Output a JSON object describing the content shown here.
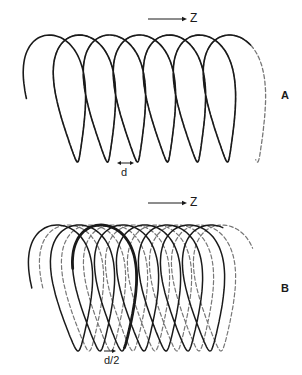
{
  "figure": {
    "panels": [
      {
        "id": "A",
        "label": "A",
        "axis_label": "Z",
        "dimension_label": "d",
        "solid_helix": {
          "x0": 56,
          "turns": 6.35,
          "pitch": 30,
          "top_y": 35,
          "bottom_y": 162,
          "rx": 34,
          "shift": 6.5,
          "color": "#1a1a1a",
          "width": 1.6
        },
        "dashed_helix": {
          "x0": 56,
          "t_start_offset": 5.2,
          "turns": 6.3,
          "pitch": 30,
          "top_y": 35,
          "bottom_y": 162,
          "rx": 34,
          "shift": 6.5,
          "color": "#777777",
          "width": 1.3,
          "phase_dx": 0
        },
        "arrow": {
          "x1": 148,
          "x2": 187,
          "y": 19
        },
        "dim": {
          "x1": 117,
          "x2": 134,
          "y": 163
        }
      },
      {
        "id": "B",
        "label": "B",
        "axis_label": "Z",
        "dimension_label": "d/2",
        "solid_helix": {
          "x0": 62,
          "turns": 7.3,
          "pitch": 22,
          "top_y": 225,
          "bottom_y": 351,
          "rx": 38,
          "shift": 5,
          "color": "#1a1a1a",
          "width": 1.5
        },
        "dashed_helix": {
          "x0": 73,
          "turns": 7.4,
          "pitch": 22,
          "top_y": 225,
          "bottom_y": 351,
          "rx": 38,
          "shift": 5,
          "color": "#777777",
          "width": 1.2
        },
        "highlight_turn": {
          "index": 2,
          "width": 2.8
        },
        "arrow": {
          "x1": 148,
          "x2": 187,
          "y": 203
        },
        "dim": {
          "x1": 104,
          "x2": 116,
          "y": 351
        }
      }
    ]
  }
}
